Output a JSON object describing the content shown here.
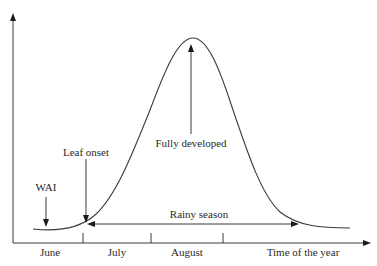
{
  "diagram": {
    "axes": {
      "x_label": "Time of the year",
      "y_label": ""
    },
    "months": [
      {
        "label": "June"
      },
      {
        "label": "July"
      },
      {
        "label": "August"
      }
    ],
    "annotations": {
      "wai": "WAI",
      "leaf_onset": "Leaf onset",
      "fully_developed": "Fully developed",
      "rainy_season": "Rainy season"
    },
    "colors": {
      "line": "#3a3a3a",
      "text": "#2a2a2a",
      "background": "#ffffff"
    }
  }
}
